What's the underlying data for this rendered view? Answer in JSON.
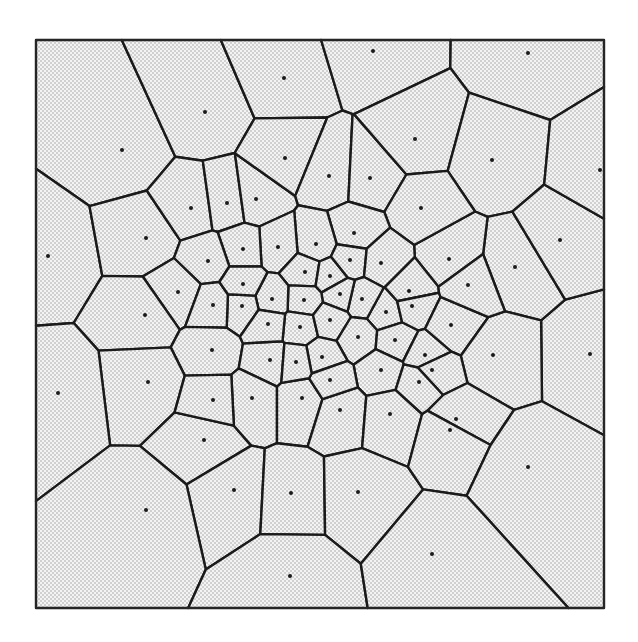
{
  "diagram": {
    "type": "voronoi-tessellation",
    "frame": {
      "x": 36,
      "y": 40,
      "width": 568,
      "height": 568
    },
    "colors": {
      "background": "#ffffff",
      "cell_fill_base": "#f4f4f4",
      "stipple_dot": "#9a9a9a",
      "edge": "#1a1a1a",
      "site": "#1a1a1a",
      "frame": "#2a2a2a"
    },
    "edge_width": 2.4,
    "site_radius": 2.0,
    "sites": [
      [
        122,
        150
      ],
      [
        205,
        112
      ],
      [
        284,
        78
      ],
      [
        373,
        51
      ],
      [
        528,
        53
      ],
      [
        48,
        256
      ],
      [
        146,
        238
      ],
      [
        191,
        208
      ],
      [
        227,
        203
      ],
      [
        256,
        199
      ],
      [
        285,
        158
      ],
      [
        329,
        176
      ],
      [
        370,
        178
      ],
      [
        415,
        139
      ],
      [
        492,
        160
      ],
      [
        590,
        354
      ],
      [
        515,
        267
      ],
      [
        449,
        259
      ],
      [
        421,
        208
      ],
      [
        354,
        233
      ],
      [
        316,
        244
      ],
      [
        278,
        247
      ],
      [
        243,
        249
      ],
      [
        208,
        261
      ],
      [
        178,
        292
      ],
      [
        145,
        315
      ],
      [
        305,
        272
      ],
      [
        330,
        276
      ],
      [
        350,
        260
      ],
      [
        381,
        263
      ],
      [
        409,
        291
      ],
      [
        386,
        312
      ],
      [
        362,
        299
      ],
      [
        340,
        294
      ],
      [
        304,
        300
      ],
      [
        272,
        299
      ],
      [
        242,
        306
      ],
      [
        213,
        305
      ],
      [
        212,
        350
      ],
      [
        148,
        382
      ],
      [
        58,
        393
      ],
      [
        270,
        360
      ],
      [
        300,
        327
      ],
      [
        330,
        320
      ],
      [
        358,
        337
      ],
      [
        395,
        340
      ],
      [
        412,
        306
      ],
      [
        425,
        355
      ],
      [
        451,
        325
      ],
      [
        493,
        355
      ],
      [
        590,
        354
      ],
      [
        322,
        357
      ],
      [
        381,
        370
      ],
      [
        432,
        370
      ],
      [
        456,
        419
      ],
      [
        204,
        440
      ],
      [
        252,
        398
      ],
      [
        302,
        398
      ],
      [
        340,
        410
      ],
      [
        390,
        414
      ],
      [
        234,
        490
      ],
      [
        291,
        493
      ],
      [
        358,
        492
      ],
      [
        450,
        430
      ],
      [
        528,
        467
      ],
      [
        146,
        510
      ],
      [
        290,
        576
      ],
      [
        432,
        554
      ],
      [
        330,
        380
      ],
      [
        419,
        382
      ],
      [
        243,
        284
      ],
      [
        268,
        324
      ],
      [
        296,
        362
      ],
      [
        213,
        400
      ],
      [
        468,
        285
      ],
      [
        560,
        240
      ],
      [
        600,
        170
      ]
    ],
    "site_count": 77
  }
}
